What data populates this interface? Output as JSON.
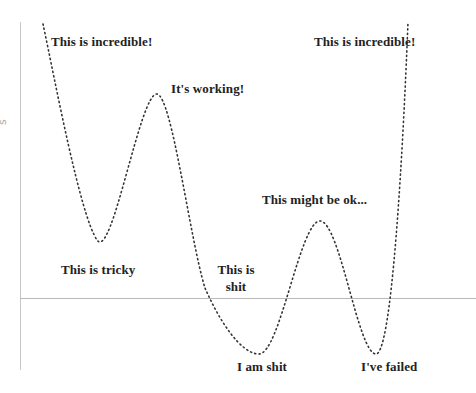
{
  "diagram": {
    "type": "emotional-rollercoaster",
    "y_axis_label": "s",
    "colors": {
      "axis": "#c8c8c8",
      "curve": "#333333",
      "text": "#222222",
      "background": "#ffffff"
    },
    "labels": {
      "start_high": "This is incredible!",
      "peak_1": "It's working!",
      "trough_1": "This is tricky",
      "dip_1_line1": "This is",
      "dip_1_line2": "shit",
      "trough_2": "I am shit",
      "peak_2": "This might be ok...",
      "trough_3": "I've failed",
      "end_high": "This is incredible!"
    },
    "curve_points": [
      {
        "x": 43,
        "y": 24,
        "label": "This is incredible!"
      },
      {
        "x": 97,
        "y": 240,
        "label": "This is tricky"
      },
      {
        "x": 157,
        "y": 94,
        "label": "It's working!"
      },
      {
        "x": 205,
        "y": 288,
        "label": "This is shit"
      },
      {
        "x": 259,
        "y": 354,
        "label": "I am shit"
      },
      {
        "x": 320,
        "y": 221,
        "label": "This might be ok..."
      },
      {
        "x": 376,
        "y": 354,
        "label": "I've failed"
      },
      {
        "x": 408,
        "y": 22,
        "label": "This is incredible!"
      }
    ]
  }
}
